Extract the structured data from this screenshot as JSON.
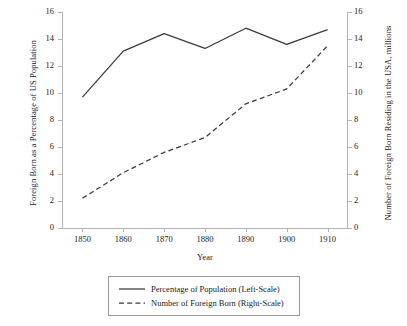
{
  "chart_data": {
    "type": "line",
    "title": "",
    "xlabel": "Year",
    "ylabel": "Foreign Born as a Percentage of US Population",
    "ylabel_right": "Number of Foreign Born Residing in the USA, millions",
    "x": [
      1850,
      1860,
      1870,
      1880,
      1890,
      1900,
      1910
    ],
    "xticklabels": [
      "1850",
      "1860",
      "1870",
      "1880",
      "1890",
      "1900",
      "1910"
    ],
    "xlim": [
      1845,
      1915
    ],
    "ylim": [
      0,
      16
    ],
    "ylim_right": [
      0,
      16
    ],
    "yticks": [
      0,
      2,
      4,
      6,
      8,
      10,
      12,
      14,
      16
    ],
    "yticklabels": [
      "0",
      "2",
      "4",
      "6",
      "8",
      "10",
      "12",
      "14",
      "16"
    ],
    "yticks_right": [
      0,
      2,
      4,
      6,
      8,
      10,
      12,
      14,
      16
    ],
    "yticklabels_right": [
      "0",
      "2",
      "4",
      "6",
      "8",
      "10",
      "12",
      "14",
      "16"
    ],
    "grid": false,
    "legend_position": "below-center",
    "series": [
      {
        "name": "Percentage of Population (Left-Scale)",
        "axis": "left",
        "style": "solid",
        "color": "#3a3a3a",
        "values": [
          9.7,
          13.1,
          14.4,
          13.3,
          14.8,
          13.6,
          14.7
        ]
      },
      {
        "name": "Number of Foreign Born (Right-Scale)",
        "axis": "right",
        "style": "dashed",
        "color": "#3a3a3a",
        "values": [
          2.2,
          4.1,
          5.6,
          6.7,
          9.2,
          10.3,
          13.5
        ]
      }
    ]
  },
  "legend": {
    "items": [
      "Percentage of Population (Left-Scale)",
      "Number of Foreign Born (Right-Scale)"
    ]
  }
}
